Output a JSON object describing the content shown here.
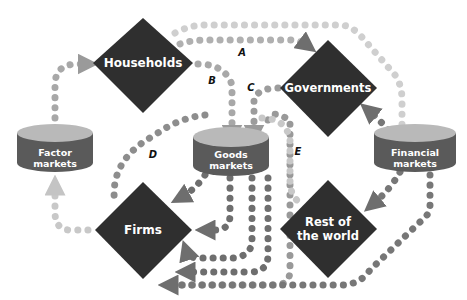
{
  "diagram": {
    "type": "circular-flow",
    "sectors": [
      {
        "id": "households",
        "label": "Households",
        "shape": "diamond"
      },
      {
        "id": "governments",
        "label": "Governments",
        "shape": "diamond"
      },
      {
        "id": "firms",
        "label": "Firms",
        "shape": "diamond"
      },
      {
        "id": "rest_of_world",
        "label_line1": "Rest of",
        "label_line2": "the world",
        "shape": "diamond"
      }
    ],
    "markets": [
      {
        "id": "factor",
        "label_line1": "Factor",
        "label_line2": "markets",
        "shape": "cylinder"
      },
      {
        "id": "goods",
        "label_line1": "Goods",
        "label_line2": "markets",
        "shape": "cylinder"
      },
      {
        "id": "financial",
        "label_line1": "Financial",
        "label_line2": "markets",
        "shape": "cylinder"
      }
    ],
    "flow_labels": [
      "A",
      "B",
      "C",
      "D",
      "E"
    ],
    "colors": {
      "diamond": "#2f2f2f",
      "cylinder_top": "#b9b9b9",
      "cylinder_side": "#5a5a5a",
      "flow_light": "#c4c4c4",
      "flow_dark": "#6e6e6e",
      "flow_medium": "#9a9a9a"
    }
  }
}
